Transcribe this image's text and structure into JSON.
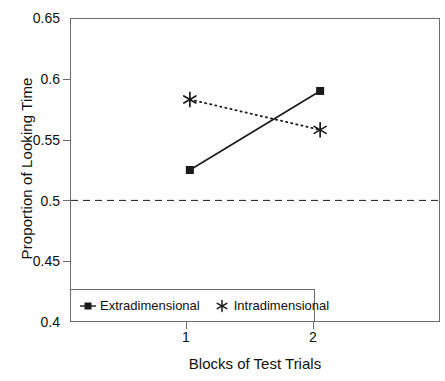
{
  "chart_data": {
    "type": "line",
    "title": "",
    "xlabel": "Blocks of Test Trials",
    "ylabel": "Proportion of Looking Time",
    "categories": [
      "1",
      "2"
    ],
    "x": [
      1,
      2
    ],
    "xlim": [
      0.08,
      2.92
    ],
    "ylim": [
      0.4,
      0.65
    ],
    "yticks": [
      0.4,
      0.45,
      0.5,
      0.55,
      0.6,
      0.65
    ],
    "ytick_labels": [
      "0.4",
      "0.45",
      "0.5",
      "0.55",
      "0.6",
      "0.65"
    ],
    "xticks": [
      1,
      2
    ],
    "xtick_labels": [
      "1",
      "2"
    ],
    "grid": false,
    "legend_position": "bottom-left-inside",
    "series": [
      {
        "name": "Extradimensional",
        "values": [
          0.525,
          0.59
        ],
        "marker": "filled-square",
        "linestyle": "solid",
        "color": "#1a1a1a"
      },
      {
        "name": "Intradimensional",
        "values": [
          0.583,
          0.558
        ],
        "marker": "asterisk",
        "linestyle": "dotted",
        "color": "#1a1a1a"
      }
    ],
    "reference_lines": [
      {
        "name": "chance-level",
        "axis": "y",
        "value": 0.5,
        "linestyle": "dashed",
        "color": "#1a1a1a"
      }
    ]
  },
  "legend": {
    "entries": [
      {
        "label": "Extradimensional",
        "marker": "filled-square"
      },
      {
        "label": "Intradimensional",
        "marker": "asterisk"
      }
    ]
  },
  "axes": {
    "y_title": "Proportion of Looking Time",
    "x_title": "Blocks of Test Trials",
    "y_tick_labels": [
      "0.65",
      "0.6",
      "0.55",
      "0.5",
      "0.45",
      "0.4"
    ],
    "x_tick_labels": [
      "1",
      "2"
    ]
  },
  "colors": {
    "ink": "#1a1a1a",
    "frame": "#6d6d6d",
    "background": "#ffffff"
  }
}
